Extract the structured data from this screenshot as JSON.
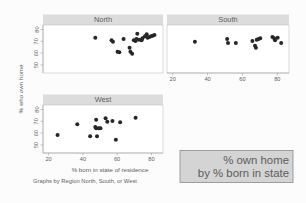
{
  "figure": {
    "ylabel": "% who own home",
    "xlabel": "% born in state of residence",
    "footer": "Graphs by Region North, South, or West",
    "callout_line1": "% own home",
    "callout_line2": "by % born in state",
    "background_color": "#fcfcfc",
    "point_color": "#262626",
    "strip_color": "#dcdcdc",
    "callout_bg_color": "#d4d4d4"
  },
  "chart_data": {
    "type": "scatter",
    "title": "",
    "xlabel": "% born in state of residence",
    "ylabel": "% who own home",
    "xlim": [
      15,
      85
    ],
    "ylim": [
      46,
      82
    ],
    "xticks": [
      20,
      40,
      60,
      80
    ],
    "yticks": [
      50,
      60,
      70,
      80
    ],
    "grid": false,
    "legend": null,
    "panel_layout": "2x2 with North top-left, South top-right, West bottom-left",
    "panels": [
      {
        "name": "North",
        "label": "North",
        "points": [
          {
            "x": 45.5,
            "y": 72.5
          },
          {
            "x": 55.0,
            "y": 70.5
          },
          {
            "x": 55.8,
            "y": 69.5
          },
          {
            "x": 58.5,
            "y": 62.0
          },
          {
            "x": 59.5,
            "y": 61.5
          },
          {
            "x": 62.0,
            "y": 71.5
          },
          {
            "x": 65.5,
            "y": 65.0
          },
          {
            "x": 66.0,
            "y": 62.0
          },
          {
            "x": 67.0,
            "y": 60.5
          },
          {
            "x": 68.0,
            "y": 70.5
          },
          {
            "x": 69.0,
            "y": 70.0
          },
          {
            "x": 69.5,
            "y": 71.5
          },
          {
            "x": 70.0,
            "y": 75.5
          },
          {
            "x": 71.0,
            "y": 71.0
          },
          {
            "x": 72.5,
            "y": 70.5
          },
          {
            "x": 73.0,
            "y": 72.0
          },
          {
            "x": 74.5,
            "y": 73.5
          },
          {
            "x": 75.5,
            "y": 75.0
          },
          {
            "x": 76.0,
            "y": 72.5
          },
          {
            "x": 77.0,
            "y": 73.0
          },
          {
            "x": 78.0,
            "y": 73.5
          },
          {
            "x": 79.0,
            "y": 74.0
          },
          {
            "x": 80.0,
            "y": 74.5
          }
        ]
      },
      {
        "name": "South",
        "label": "South",
        "points": [
          {
            "x": 31.0,
            "y": 69.5
          },
          {
            "x": 49.5,
            "y": 71.5
          },
          {
            "x": 50.0,
            "y": 68.5
          },
          {
            "x": 54.5,
            "y": 68.5
          },
          {
            "x": 64.0,
            "y": 70.0
          },
          {
            "x": 65.5,
            "y": 66.5
          },
          {
            "x": 66.0,
            "y": 65.0
          },
          {
            "x": 66.5,
            "y": 71.0
          },
          {
            "x": 67.5,
            "y": 71.5
          },
          {
            "x": 68.5,
            "y": 72.0
          },
          {
            "x": 75.5,
            "y": 73.0
          },
          {
            "x": 76.5,
            "y": 72.0
          },
          {
            "x": 77.0,
            "y": 70.5
          },
          {
            "x": 78.5,
            "y": 72.5
          },
          {
            "x": 80.5,
            "y": 68.5
          }
        ]
      },
      {
        "name": "West",
        "label": "West",
        "points": [
          {
            "x": 23.5,
            "y": 59.5
          },
          {
            "x": 35.0,
            "y": 67.5
          },
          {
            "x": 42.5,
            "y": 58.5
          },
          {
            "x": 45.5,
            "y": 65.5
          },
          {
            "x": 46.0,
            "y": 64.5
          },
          {
            "x": 46.5,
            "y": 58.5
          },
          {
            "x": 47.5,
            "y": 64.5
          },
          {
            "x": 46.0,
            "y": 71.0
          },
          {
            "x": 48.5,
            "y": 64.5
          },
          {
            "x": 51.5,
            "y": 72.0
          },
          {
            "x": 52.5,
            "y": 69.5
          },
          {
            "x": 55.5,
            "y": 70.0
          },
          {
            "x": 57.5,
            "y": 56.0
          },
          {
            "x": 60.0,
            "y": 69.0
          },
          {
            "x": 69.0,
            "y": 72.5
          }
        ]
      }
    ]
  }
}
